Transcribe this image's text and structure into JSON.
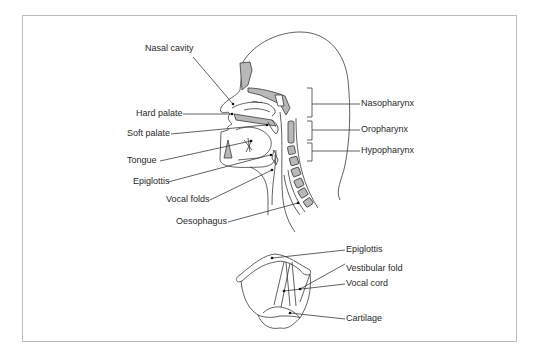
{
  "figure": {
    "type": "anatomical-diagram",
    "sagittal_view": {
      "left_labels": [
        {
          "id": "nasal_cavity",
          "text": "Nasal cavity"
        },
        {
          "id": "hard_palate",
          "text": "Hard palate"
        },
        {
          "id": "soft_palate",
          "text": "Soft palate"
        },
        {
          "id": "tongue",
          "text": "Tongue"
        },
        {
          "id": "epiglottis",
          "text": "Epiglottis"
        },
        {
          "id": "vocal_folds",
          "text": "Vocal folds"
        },
        {
          "id": "oesophagus",
          "text": "Oesophagus"
        }
      ],
      "right_labels": [
        {
          "id": "nasopharynx",
          "text": "Nasopharynx"
        },
        {
          "id": "oropharynx",
          "text": "Oropharynx"
        },
        {
          "id": "hypopharynx",
          "text": "Hypopharynx"
        }
      ]
    },
    "larynx_view": {
      "labels": [
        {
          "id": "epiglottis",
          "text": "Epiglottis"
        },
        {
          "id": "vestibular_fold",
          "text": "Vestibular fold"
        },
        {
          "id": "vocal_cord",
          "text": "Vocal cord"
        },
        {
          "id": "cartilage",
          "text": "Cartilage"
        }
      ]
    },
    "colors": {
      "line": "#3a3a3a",
      "fill_grey": "#b8b8b8",
      "frame": "#bdbdbd",
      "background": "#ffffff"
    }
  }
}
